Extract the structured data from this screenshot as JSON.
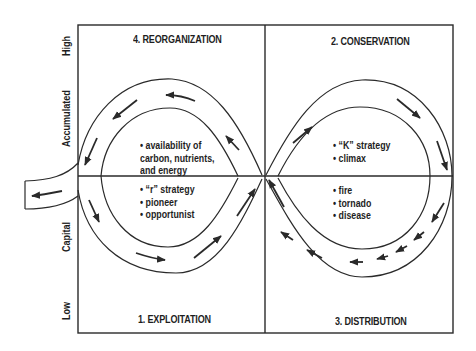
{
  "diagram": {
    "type": "adaptive-cycle",
    "y_axis": {
      "labels": [
        "High",
        "Accumulated",
        "Capital",
        "Low"
      ]
    },
    "quadrants": [
      {
        "id": "q4",
        "title": "4. REORGANIZATION",
        "position": "top-left",
        "items": [
          "• availability of",
          "carbon, nutrients,",
          "and energy"
        ]
      },
      {
        "id": "q2",
        "title": "2. CONSERVATION",
        "position": "top-right",
        "items": [
          "• “K” strategy",
          "• climax"
        ]
      },
      {
        "id": "q1",
        "title": "1. EXPLOITATION",
        "position": "bottom-left",
        "items": [
          "• “r” strategy",
          "• pioneer",
          "• opportunist"
        ]
      },
      {
        "id": "q3",
        "title": "3. DISTRIBUTION",
        "position": "bottom-right",
        "items": [
          "• fire",
          "• tornado",
          "• disease"
        ]
      }
    ],
    "flow": {
      "shape": "figure-eight",
      "direction": "1 → 2 → 3 → 4 → 1, with exit tail leaving the loop on the left",
      "line_color": "#2a2a2a"
    }
  }
}
